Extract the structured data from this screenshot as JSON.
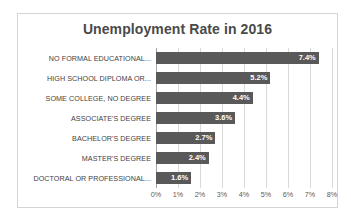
{
  "chart_data": {
    "type": "bar",
    "orientation": "horizontal",
    "title": "Unemployment Rate in 2016",
    "xlabel": "",
    "ylabel": "",
    "xlim": [
      0,
      8
    ],
    "xticks": [
      "0%",
      "1%",
      "2%",
      "3%",
      "4%",
      "5%",
      "6%",
      "7%",
      "8%"
    ],
    "xtick_values": [
      0,
      1,
      2,
      3,
      4,
      5,
      6,
      7,
      8
    ],
    "grid": true,
    "legend": false,
    "bar_color": "#595959",
    "categories": [
      "NO FORMAL EDUCATIONAL...",
      "HIGH SCHOOL DIPLOMA OR...",
      "SOME COLLEGE, NO DEGREE",
      "ASSOCIATE'S DEGREE",
      "BACHELOR'S DEGREE",
      "MASTER'S DEGREE",
      "DOCTORAL OR PROFESSIONAL..."
    ],
    "values": [
      7.4,
      5.2,
      4.4,
      3.6,
      2.7,
      2.4,
      1.6
    ],
    "data_labels": [
      "7.4%",
      "5.2%",
      "4.4%",
      "3.6%",
      "2.7%",
      "2.4%",
      "1.6%"
    ]
  }
}
